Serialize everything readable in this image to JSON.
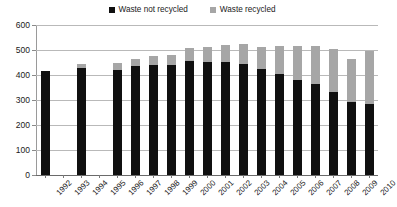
{
  "chart_data": {
    "type": "bar",
    "subtype": "stacked-column",
    "title": "",
    "xlabel": "",
    "ylabel": "",
    "ylim": [
      0,
      600
    ],
    "ytick_step": 100,
    "yticks": [
      0,
      100,
      200,
      300,
      400,
      500,
      600
    ],
    "grid": true,
    "legend_position": "top-center",
    "categories": [
      "1992",
      "1993",
      "1994",
      "1995",
      "1996",
      "1997",
      "1998",
      "1999",
      "2000",
      "2001",
      "2002",
      "2003",
      "2004",
      "2005",
      "2006",
      "2007",
      "2008",
      "2009",
      "2010"
    ],
    "series": [
      {
        "name": "Waste not recycled",
        "color": "#101010",
        "values": [
          415,
          null,
          430,
          null,
          420,
          435,
          440,
          439,
          458,
          451,
          452,
          443,
          424,
          403,
          379,
          364,
          333,
          293,
          285
        ]
      },
      {
        "name": "Waste recycled",
        "color": "#a6a6a6",
        "values": [
          0,
          null,
          15,
          null,
          30,
          30,
          38,
          43,
          50,
          61,
          68,
          82,
          90,
          114,
          137,
          154,
          172,
          172,
          212
        ]
      }
    ],
    "totals": [
      415,
      null,
      445,
      null,
      450,
      465,
      478,
      482,
      508,
      512,
      520,
      525,
      514,
      517,
      516,
      518,
      505,
      465,
      497
    ]
  },
  "legend": {
    "entries": [
      {
        "label": "Waste not recycled",
        "color": "#101010"
      },
      {
        "label": "Waste recycled",
        "color": "#a6a6a6"
      }
    ]
  },
  "axes": {
    "y": {
      "tick_labels": [
        "600",
        "500",
        "400",
        "300",
        "200",
        "100",
        "0"
      ]
    },
    "x": {
      "tick_labels": [
        "1992",
        "1993",
        "1994",
        "1995",
        "1996",
        "1997",
        "1998",
        "1999",
        "2000",
        "2001",
        "2002",
        "2003",
        "2004",
        "2005",
        "2006",
        "2007",
        "2008",
        "2009",
        "2010"
      ]
    }
  }
}
